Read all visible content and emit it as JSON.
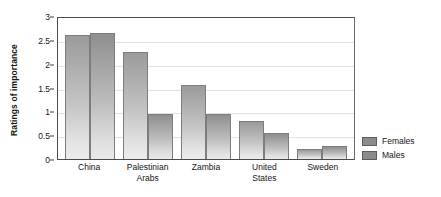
{
  "chart_data": {
    "type": "bar",
    "title": "",
    "xlabel": "",
    "ylabel": "Ratings of importance",
    "categories": [
      "China",
      "Palestinian Arabs",
      "Zambia",
      "United States",
      "Sweden"
    ],
    "category_lines": [
      [
        "China"
      ],
      [
        "Palestinian",
        "Arabs"
      ],
      [
        "Zambia"
      ],
      [
        "United",
        "States"
      ],
      [
        "Sweden"
      ]
    ],
    "series": [
      {
        "name": "Females",
        "values": [
          2.6,
          2.25,
          1.55,
          0.8,
          0.22
        ]
      },
      {
        "name": "Males",
        "values": [
          2.65,
          0.95,
          0.95,
          0.55,
          0.27
        ]
      }
    ],
    "ylim": [
      0,
      3
    ],
    "ytick_values": [
      0,
      0.5,
      1,
      1.5,
      2,
      2.5,
      3
    ],
    "ytick_labels": [
      "0",
      "0.5",
      "1",
      "1.5",
      "2",
      "2.5",
      "3"
    ],
    "grid": true,
    "grid_axis": "y",
    "legend_position": "right",
    "legend_entries": [
      "Females",
      "Males"
    ],
    "colors": {
      "bar_top": "#9b9b9b",
      "bar_bottom": "#ececec",
      "bar_outline": "#7d7d7d",
      "legend_swatch": "#8b8b8b",
      "axis": "#4a4a4a",
      "grid": "#e3e3e3",
      "text": "#151515",
      "background": "#ffffff"
    }
  }
}
